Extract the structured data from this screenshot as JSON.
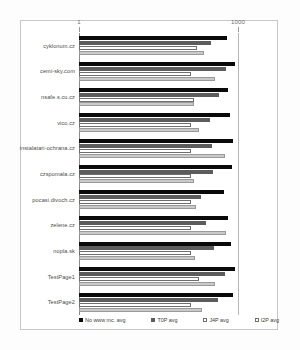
{
  "chart_data": {
    "type": "bar",
    "orientation": "horizontal",
    "title": "",
    "xlabel": "",
    "ylabel": "",
    "xscale": "log",
    "xlim": [
      1,
      1000
    ],
    "xticks": [
      1,
      1000
    ],
    "xtick_labels": [
      "1",
      "1000"
    ],
    "grid": false,
    "legend_position": "bottom",
    "categories": [
      "cyklonum.cz",
      "cemi-sky.com",
      "nsafe.s.cu.cz",
      "vico.cz",
      "instalatari-ochrana.cz",
      "czspomala.cz",
      "pocasi.divoch.cz",
      "zelene.cz",
      "nopla.sk",
      "TestPage1",
      "TestPage2"
    ],
    "series": [
      {
        "name": "No www mc. avg",
        "fill": "#0a0a0a",
        "values": [
          630,
          880,
          650,
          700,
          810,
          770,
          540,
          650,
          740,
          870,
          800
        ]
      },
      {
        "name": "T0P avg",
        "fill": "#5c5c5c",
        "values": [
          310,
          600,
          430,
          300,
          330,
          340,
          200,
          250,
          350,
          560,
          420
        ]
      },
      {
        "name": "J4P avg",
        "fill": "#ffffff",
        "values": [
          170,
          130,
          150,
          130,
          130,
          130,
          130,
          130,
          130,
          180,
          130
        ]
      },
      {
        "name": "I2P avg",
        "fill": "#c9c9c9",
        "values": [
          225,
          370,
          145,
          185,
          570,
          145,
          160,
          590,
          155,
          370,
          205
        ]
      }
    ]
  },
  "axis": {
    "tick_low": "1",
    "tick_high": "1000"
  }
}
